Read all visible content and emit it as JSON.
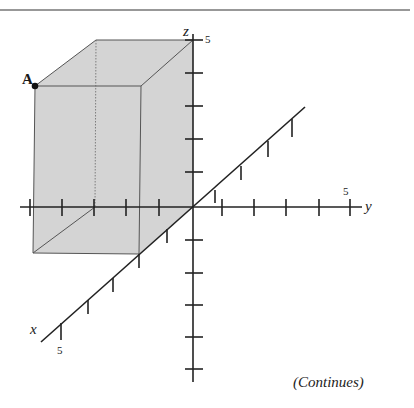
{
  "diagram": {
    "type": "3d-coordinate-box",
    "axes": {
      "x": {
        "label": "x",
        "max_tick_label": "5"
      },
      "y": {
        "label": "y",
        "max_tick_label": "5"
      },
      "z": {
        "label": "z",
        "max_tick_label": "5"
      }
    },
    "point": {
      "label": "A"
    },
    "box_fill_color": "#d4d4d4",
    "line_color": "#222222"
  },
  "caption": "(Continues)"
}
